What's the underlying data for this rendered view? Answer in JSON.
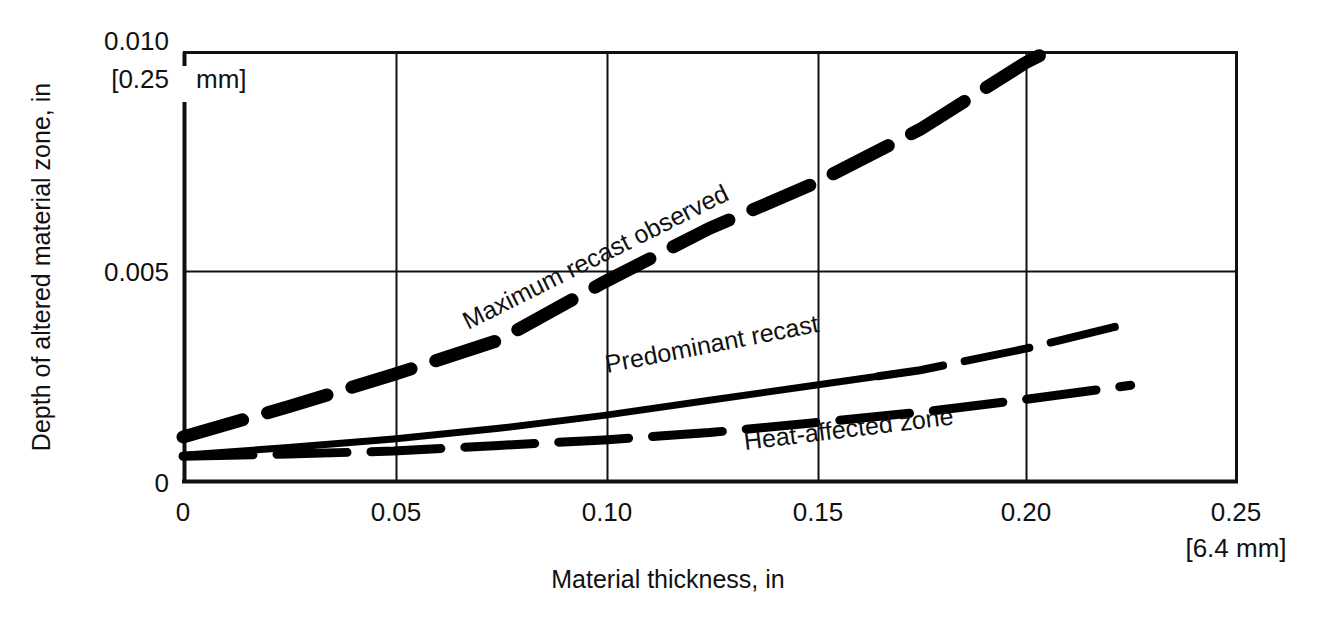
{
  "chart_data": {
    "type": "line",
    "title": "",
    "xlabel": "Material thickness, in",
    "ylabel": "Depth of altered material zone, in",
    "xlim": [
      0,
      0.25
    ],
    "ylim": [
      0,
      0.01
    ],
    "grid": true,
    "legend_position": "inline-labels",
    "x_ticks": [
      "0",
      "0.05",
      "0.10",
      "0.15",
      "0.20",
      "0.25"
    ],
    "x_tick_values": [
      0,
      0.05,
      0.1,
      0.15,
      0.2,
      0.25
    ],
    "y_ticks": [
      "0",
      "0.005",
      "0.010"
    ],
    "y_tick_values": [
      0,
      0.005,
      0.01
    ],
    "y_axis_unit_note": "[0.25  mm]",
    "y_axis_unit_note_mm": "mm]",
    "y_axis_unit_note_value": "[0.25",
    "x_axis_unit_note": "[6.4 mm]",
    "series": [
      {
        "name": "Maximum recast observed",
        "style": "thick-dashed",
        "label": "Maximum recast observed",
        "x": [
          0.0,
          0.025,
          0.05,
          0.075,
          0.1,
          0.125,
          0.15,
          0.175,
          0.2,
          0.205
        ],
        "values": [
          0.00105,
          0.00175,
          0.0025,
          0.0033,
          0.00465,
          0.0059,
          0.00695,
          0.0082,
          0.00975,
          0.01
        ]
      },
      {
        "name": "Predominant recast",
        "style": "thin-solid-then-dashed",
        "label": "Predominant recast",
        "dash_starts_at_x": 0.165,
        "x": [
          0.0,
          0.025,
          0.05,
          0.075,
          0.1,
          0.125,
          0.15,
          0.175,
          0.2,
          0.223
        ],
        "values": [
          0.00062,
          0.0008,
          0.001,
          0.00125,
          0.00155,
          0.0019,
          0.00225,
          0.0026,
          0.0031,
          0.00365
        ]
      },
      {
        "name": "Heat-affected zone",
        "style": "medium-dashed",
        "label": "Heat-affected zone",
        "x": [
          0.0,
          0.025,
          0.05,
          0.075,
          0.1,
          0.125,
          0.15,
          0.175,
          0.2,
          0.225
        ],
        "values": [
          0.0006,
          0.00065,
          0.00072,
          0.00085,
          0.00098,
          0.00115,
          0.00138,
          0.00162,
          0.00192,
          0.00225
        ]
      }
    ]
  }
}
